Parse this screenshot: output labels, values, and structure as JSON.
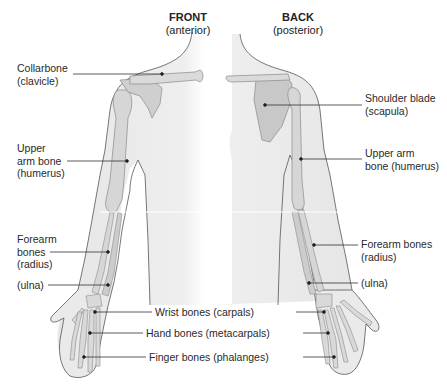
{
  "views": {
    "front": {
      "title": "FRONT",
      "subtitle": "(anterior)"
    },
    "back": {
      "title": "BACK",
      "subtitle": "(posterior)"
    }
  },
  "labels": {
    "collarbone": {
      "line1": "Collarbone",
      "line2": "(clavicle)"
    },
    "upper_arm_front": {
      "line1": "Upper",
      "line2": "arm bone",
      "line3": "(humerus)"
    },
    "forearm_front": {
      "line1": "Forearm",
      "line2": "bones",
      "line3": "(radius)"
    },
    "ulna_front": {
      "line1": "(ulna)"
    },
    "shoulder_blade": {
      "line1": "Shoulder blade",
      "line2": "(scapula)"
    },
    "upper_arm_back": {
      "line1": "Upper arm",
      "line2": "bone (humerus)"
    },
    "forearm_back": {
      "line1": "Forearm bones",
      "line2": "(radius)"
    },
    "ulna_back": {
      "line1": "(ulna)"
    },
    "wrist": {
      "line1": "Wrist bones (carpals)"
    },
    "hand": {
      "line1": "Hand bones (metacarpals)"
    },
    "finger": {
      "line1": "Finger bones (phalanges)"
    }
  },
  "colors": {
    "skin_fill": "#ececec",
    "outline": "#555555",
    "bone_fill": "#d8d8d8",
    "bone_shade": "#9a9a9a",
    "leader": "#333333"
  }
}
